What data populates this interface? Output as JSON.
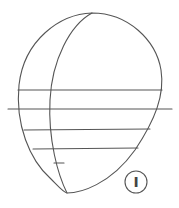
{
  "figure": {
    "step_label": "I",
    "stroke_color": "#555555",
    "background": "#ffffff"
  }
}
